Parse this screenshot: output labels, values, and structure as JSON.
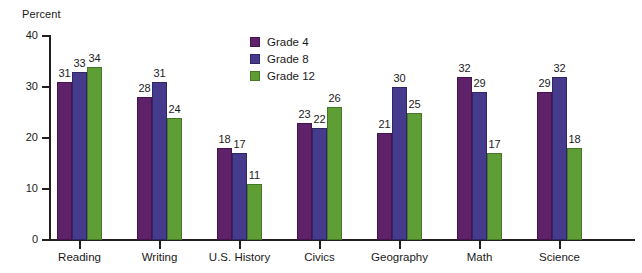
{
  "chart_data": {
    "type": "bar",
    "title": "",
    "xlabel": "",
    "ylabel": "Percent",
    "ylim": [
      0,
      40
    ],
    "yticks": [
      0,
      10,
      20,
      30,
      40
    ],
    "grid": false,
    "legend_position": "top-center",
    "categories": [
      "Reading",
      "Writing",
      "U.S. History",
      "Civics",
      "Geography",
      "Math",
      "Science"
    ],
    "series": [
      {
        "name": "Grade 4",
        "color": "#5f2169",
        "values": [
          31,
          28,
          18,
          23,
          21,
          32,
          29
        ]
      },
      {
        "name": "Grade 8",
        "color": "#463a8c",
        "values": [
          33,
          31,
          17,
          22,
          30,
          29,
          32
        ]
      },
      {
        "name": "Grade 12",
        "color": "#5f9e35",
        "values": [
          34,
          24,
          11,
          26,
          25,
          17,
          18
        ]
      }
    ]
  }
}
